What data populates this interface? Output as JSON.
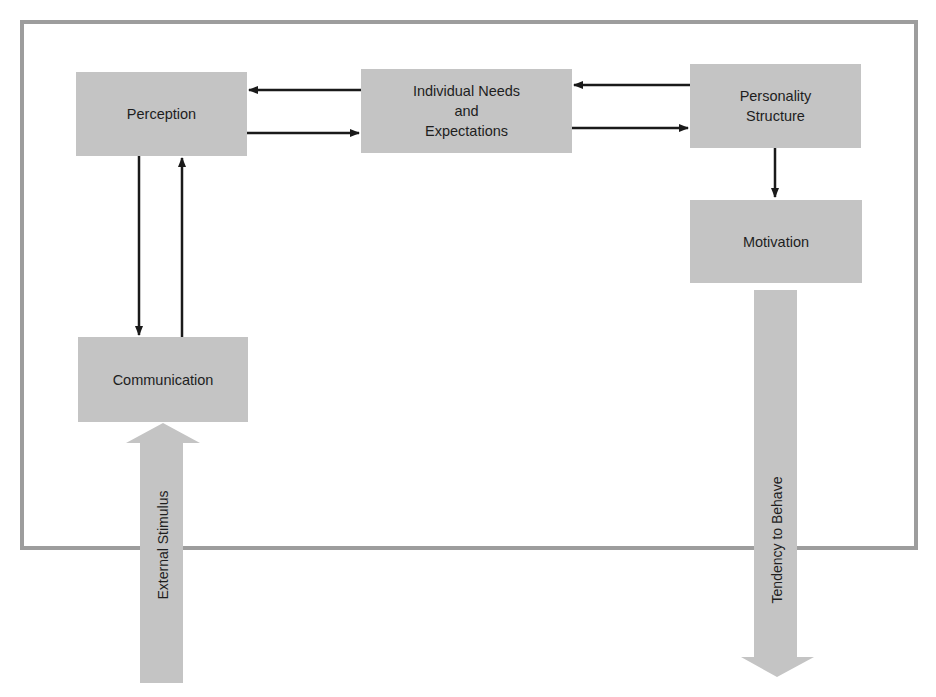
{
  "diagram": {
    "nodes": [
      {
        "id": "perception",
        "label": "Perception"
      },
      {
        "id": "needs",
        "label": "Individual Needs\nand\nExpectations"
      },
      {
        "id": "personality",
        "label": "Personality\nStructure"
      },
      {
        "id": "motivation",
        "label": "Motivation"
      },
      {
        "id": "communication",
        "label": "Communication"
      }
    ],
    "edges": [
      {
        "from": "needs",
        "to": "perception"
      },
      {
        "from": "perception",
        "to": "needs"
      },
      {
        "from": "personality",
        "to": "needs"
      },
      {
        "from": "needs",
        "to": "personality"
      },
      {
        "from": "personality",
        "to": "motivation"
      },
      {
        "from": "perception",
        "to": "communication"
      },
      {
        "from": "communication",
        "to": "perception"
      }
    ],
    "flows": {
      "input": {
        "label": "External Stimulus",
        "to": "communication"
      },
      "output": {
        "label": "Tendency to Behave",
        "from": "motivation"
      }
    },
    "colors": {
      "box_fill": "#c4c4c4",
      "frame_border": "#9d9d9d",
      "arrow": "#1a1a1a",
      "flow_arrow": "#c4c4c4"
    }
  }
}
